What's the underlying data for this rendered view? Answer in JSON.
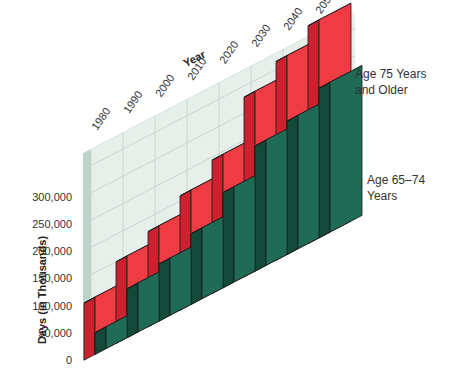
{
  "chart_data": {
    "type": "bar",
    "stacked": true,
    "three_d": true,
    "title": "",
    "xlabel": "Year",
    "ylabel": "Days (in Thousands)",
    "categories": [
      "1980",
      "1990",
      "2000",
      "2010",
      "2020",
      "2030",
      "2040",
      "2050"
    ],
    "series": [
      {
        "name": "Age 65–74 Years",
        "color": "#1f6b55",
        "values": [
          40000,
          90000,
          105000,
          130000,
          175000,
          230000,
          245000,
          275000
        ]
      },
      {
        "name": "Age 75 Years and Older",
        "color": "#ee3b44",
        "values": [
          65000,
          60000,
          70000,
          80000,
          70000,
          100000,
          120000,
          125000
        ]
      }
    ],
    "yticks": [
      "0",
      "50,000",
      "100,000",
      "150,000",
      "200,000",
      "250,000",
      "300,000"
    ],
    "ylim": [
      0,
      300000
    ],
    "grid": true,
    "legend_position": "right (inline labels)"
  },
  "labels": {
    "xlabel": "Year",
    "ylabel": "Days (in Thousands)",
    "legend_75_line1": "Age 75 Years",
    "legend_75_line2": "and Older",
    "legend_65": "Age 65–74 Years"
  }
}
